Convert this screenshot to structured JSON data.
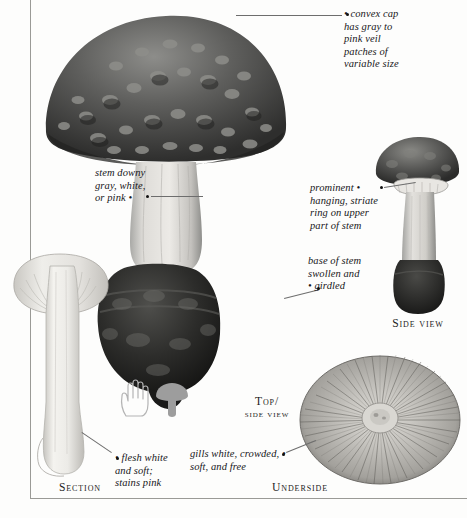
{
  "page": {
    "kind": "field-guide-plate",
    "background_color": "#fdfdfc",
    "rule_color": "#9a9a96"
  },
  "annotations": [
    {
      "id": "cap",
      "name": "annotation-convex-cap",
      "lines": [
        "• convex cap",
        "has gray to",
        "pink veil",
        "patches of",
        "variable size"
      ],
      "text": "convex cap has gray to pink veil patches of variable size",
      "align": "left",
      "bullet": "leading"
    },
    {
      "id": "stem-downy",
      "name": "annotation-stem-downy",
      "lines": [
        "stem downy",
        "gray, white,",
        "or pink •"
      ],
      "text": "stem downy gray, white, or pink",
      "align": "left",
      "bullet": "trailing"
    },
    {
      "id": "ring",
      "name": "annotation-prominent-ring",
      "lines": [
        "prominent •",
        "hanging, striate",
        "ring on upper",
        "part of stem"
      ],
      "text": "prominent hanging, striate ring on upper part of stem",
      "align": "left",
      "bullet": "trailing-first-line"
    },
    {
      "id": "base",
      "name": "annotation-stem-base",
      "lines": [
        "base of stem",
        "swollen and",
        "• girdled"
      ],
      "text": "base of stem swollen and girdled",
      "align": "left",
      "bullet": "leading-last-line"
    },
    {
      "id": "flesh",
      "name": "annotation-flesh",
      "lines": [
        "• flesh white",
        "and soft;",
        "stains pink"
      ],
      "text": "flesh white and soft; stains pink",
      "align": "left",
      "bullet": "leading"
    },
    {
      "id": "gills",
      "name": "annotation-gills",
      "lines": [
        "gills white, crowded, •",
        "soft, and free"
      ],
      "text": "gills white, crowded, soft, and free",
      "align": "left",
      "bullet": "trailing-first-line"
    }
  ],
  "view_labels": [
    {
      "id": "side",
      "name": "view-label-side",
      "text": "Side view",
      "line1": "Side view",
      "line2": ""
    },
    {
      "id": "top-side",
      "name": "view-label-top-side",
      "text": "Top/ side view",
      "line1": "Top/",
      "line2": "side view"
    },
    {
      "id": "section",
      "name": "view-label-section",
      "text": "Section",
      "line1": "Section",
      "line2": ""
    },
    {
      "id": "underside",
      "name": "view-label-underside",
      "text": "Underside",
      "line1": "Underside",
      "line2": ""
    }
  ],
  "specimens": [
    {
      "id": "main",
      "name": "specimen-main-whole",
      "description": "large whole mushroom, warty convex cap, downy stem, swollen girdled base"
    },
    {
      "id": "side",
      "name": "specimen-side-view",
      "description": "smaller mushroom seen from the side with prominent ring"
    },
    {
      "id": "section",
      "name": "specimen-section",
      "description": "mushroom cut lengthwise showing white flesh"
    },
    {
      "id": "underside",
      "name": "specimen-underside",
      "description": "cap underside showing crowded radiating white gills"
    }
  ],
  "scale_icon": {
    "name": "size-comparison-icon",
    "description": "outline of a human hand beside a solid mushroom silhouette indicating scale",
    "hand_color": "#b9b9b9",
    "mushroom_color": "#9d9d9d"
  },
  "colors": {
    "cap_dark": "#3b3b3b",
    "cap_mid": "#6b6b6b",
    "stem_light": "#d8d8d6",
    "base_dark": "#2a2a2a",
    "gill_pale": "#e6e6e4",
    "text": "#17171a",
    "leader": "#6d6d6d"
  }
}
